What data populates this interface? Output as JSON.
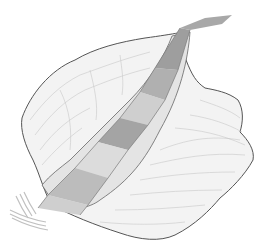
{
  "figure": {
    "caption_fragment": "",
    "colors": {
      "background": "#ffffff",
      "terrain_fill": "#f2f2f2",
      "terrain_outline": "#555555",
      "contour": "#c4c4c4",
      "band_dark": "#9e9e9e",
      "band_mid": "#b4b4b4",
      "band_light": "#d8d8d8",
      "band_edge": "#7a7a7a"
    }
  }
}
